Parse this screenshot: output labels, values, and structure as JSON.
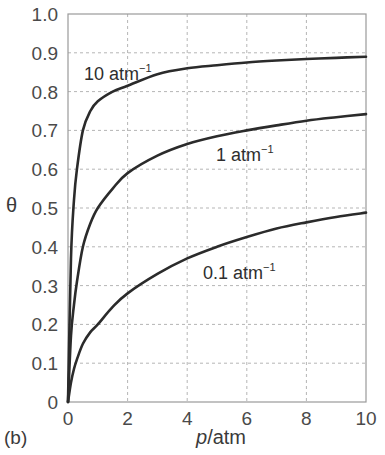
{
  "chart_data": {
    "type": "line",
    "title": "",
    "panel_label": "(b)",
    "xlabel_italic": "p",
    "xlabel_rest": "/atm",
    "xlabel": "p/atm",
    "ylabel": "θ",
    "xlim": [
      0,
      10
    ],
    "ylim": [
      0,
      1.0
    ],
    "grid": true,
    "x_ticks": [
      "0",
      "2",
      "4",
      "6",
      "8",
      "10"
    ],
    "y_ticks": [
      "0",
      "0.1",
      "0.2",
      "0.3",
      "0.4",
      "0.5",
      "0.6",
      "0.7",
      "0.8",
      "0.9",
      "1.0"
    ],
    "series": [
      {
        "name": "10 atm⁻¹",
        "label_main": "10 atm",
        "label_sup": "−1",
        "x": [
          0,
          0.1,
          0.2,
          0.3,
          0.5,
          0.75,
          1,
          1.5,
          2,
          3,
          4,
          5,
          6,
          7,
          8,
          9,
          10
        ],
        "values": [
          0,
          0.37,
          0.52,
          0.6,
          0.7,
          0.75,
          0.775,
          0.8,
          0.815,
          0.845,
          0.86,
          0.868,
          0.875,
          0.88,
          0.884,
          0.887,
          0.89
        ]
      },
      {
        "name": "1 atm⁻¹",
        "label_main": "1 atm",
        "label_sup": "−1",
        "x": [
          0,
          0.1,
          0.2,
          0.3,
          0.5,
          0.75,
          1,
          1.5,
          2,
          3,
          4,
          5,
          6,
          7,
          8,
          9,
          10
        ],
        "values": [
          0,
          0.17,
          0.25,
          0.31,
          0.4,
          0.46,
          0.5,
          0.55,
          0.59,
          0.635,
          0.665,
          0.685,
          0.7,
          0.713,
          0.725,
          0.734,
          0.742
        ]
      },
      {
        "name": "0.1 atm⁻¹",
        "label_main": "0.1 atm",
        "label_sup": "−1",
        "x": [
          0,
          0.1,
          0.2,
          0.3,
          0.5,
          0.75,
          1,
          1.5,
          2,
          3,
          4,
          5,
          6,
          7,
          8,
          9,
          10
        ],
        "values": [
          0,
          0.05,
          0.085,
          0.11,
          0.15,
          0.18,
          0.2,
          0.245,
          0.28,
          0.33,
          0.37,
          0.4,
          0.425,
          0.447,
          0.463,
          0.477,
          0.488
        ]
      }
    ],
    "annotations": [
      {
        "text": "10 atm⁻¹",
        "series": 0,
        "x": 0.5,
        "y": 0.83
      },
      {
        "text": "1 atm⁻¹",
        "series": 1,
        "x": 4.0,
        "y": 0.6
      },
      {
        "text": "0.1 atm⁻¹",
        "series": 2,
        "x": 3.6,
        "y": 0.3
      }
    ]
  }
}
